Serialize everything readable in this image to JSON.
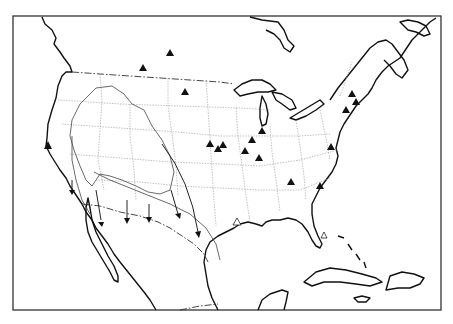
{
  "map": {
    "type": "outline map",
    "region": "North America (United States, southern Canada, northern Mexico, Caribbean)",
    "frame": {
      "x": 13,
      "y": 16,
      "width": 428,
      "height": 294
    },
    "colors": {
      "background": "#ffffff",
      "lines": "#111111",
      "state_borders": "#999999"
    },
    "legend": null,
    "title": null
  },
  "markers": {
    "filled_triangles": [
      {
        "x": 170,
        "y": 53
      },
      {
        "x": 143,
        "y": 68
      },
      {
        "x": 185,
        "y": 92
      },
      {
        "x": 48,
        "y": 146
      },
      {
        "x": 48,
        "y": 148
      },
      {
        "x": 210,
        "y": 144
      },
      {
        "x": 218,
        "y": 149
      },
      {
        "x": 223,
        "y": 145
      },
      {
        "x": 262,
        "y": 131
      },
      {
        "x": 252,
        "y": 140
      },
      {
        "x": 245,
        "y": 151
      },
      {
        "x": 259,
        "y": 158
      },
      {
        "x": 291,
        "y": 182
      },
      {
        "x": 320,
        "y": 186
      },
      {
        "x": 352,
        "y": 94
      },
      {
        "x": 356,
        "y": 102
      },
      {
        "x": 360,
        "y": 104
      },
      {
        "x": 346,
        "y": 110
      },
      {
        "x": 331,
        "y": 147
      }
    ],
    "open_triangles": [
      {
        "x": 237,
        "y": 222
      },
      {
        "x": 324,
        "y": 236
      }
    ]
  },
  "arrows": [
    {
      "from": [
        96,
        198
      ],
      "to": [
        102,
        222
      ]
    },
    {
      "from": [
        127,
        205
      ],
      "to": [
        127,
        221
      ]
    },
    {
      "from": [
        149,
        209
      ],
      "to": [
        149,
        220
      ]
    },
    {
      "from": [
        171,
        190
      ],
      "to": [
        179,
        216
      ]
    },
    {
      "from": [
        161,
        147
      ],
      "to": [
        199,
        237
      ]
    },
    {
      "from": [
        74,
        182
      ],
      "to": [
        71,
        194
      ]
    }
  ]
}
